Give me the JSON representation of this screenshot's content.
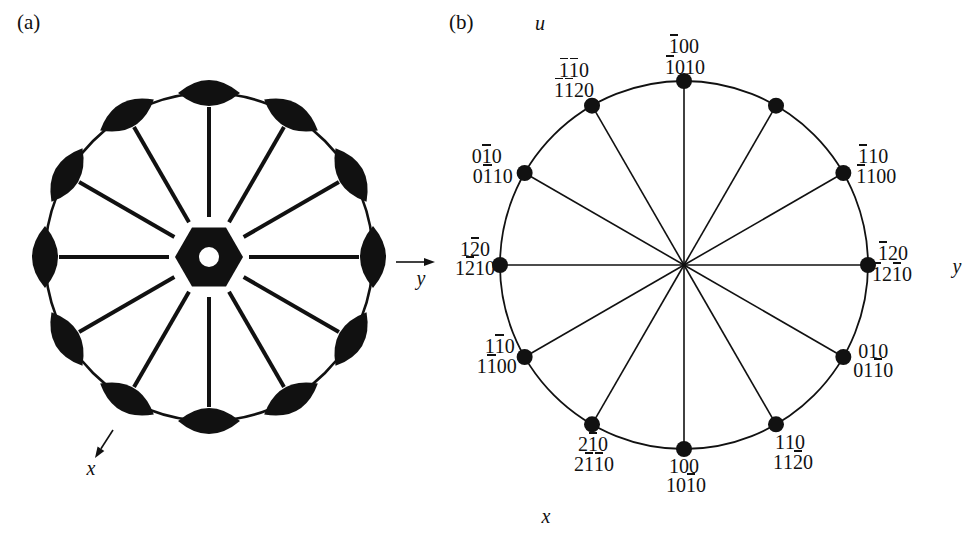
{
  "ink": "#111111",
  "background": "#ffffff",
  "panel_a": {
    "label": "(a)",
    "axis_labels": {
      "x": "x",
      "y": "y"
    },
    "twofold_symbol_count": 12,
    "center_symbol": "sixfold-hexagon"
  },
  "panel_b": {
    "label": "(b)",
    "axis_labels": {
      "u": "u",
      "x": "x",
      "y": "y"
    },
    "center_pole": {
      "miller": "001",
      "miller_bravais": "0001"
    },
    "rim_poles": [
      {
        "angle_deg": 90,
        "miller": "1̅00",
        "miller_bravais": "1̅010"
      },
      {
        "angle_deg": 120,
        "miller": "1̅1̅0",
        "miller_bravais": "1̅1̅20"
      },
      {
        "angle_deg": 150,
        "miller": "01̅0",
        "miller_bravais": "01̅10"
      },
      {
        "angle_deg": 180,
        "miller": "12̅0",
        "miller_bravais": "12̅10"
      },
      {
        "angle_deg": 210,
        "miller": "11̅0",
        "miller_bravais": "11̅00"
      },
      {
        "angle_deg": 240,
        "miller": "21̅0",
        "miller_bravais": "21̅1̅0"
      },
      {
        "angle_deg": 270,
        "miller": "100",
        "miller_bravais": "101̅0"
      },
      {
        "angle_deg": 300,
        "miller": "110",
        "miller_bravais": "112̅0"
      },
      {
        "angle_deg": 330,
        "miller": "010",
        "miller_bravais": "011̅0"
      },
      {
        "angle_deg": 0,
        "miller": "1̅20",
        "miller_bravais": "1̅21̅0"
      },
      {
        "angle_deg": 30,
        "miller": "1̅10",
        "miller_bravais": "1̅100"
      },
      {
        "angle_deg": 60,
        "miller": "2̅10",
        "miller_bravais": "2̅110"
      }
    ]
  }
}
